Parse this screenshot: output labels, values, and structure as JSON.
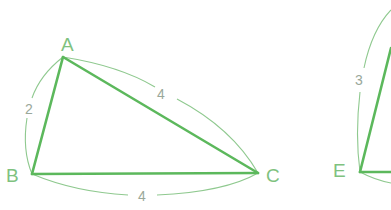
{
  "figure": {
    "colors": {
      "edge": "#5cb85c",
      "arc": "#8fc98f",
      "vertex_label": "#7fc27f",
      "measure_label": "#9aa89a",
      "background": "#ffffff"
    },
    "triangle_abc": {
      "vertices": {
        "A": {
          "label": "A",
          "x": 63,
          "y": 57
        },
        "B": {
          "label": "B",
          "x": 32,
          "y": 174
        },
        "C": {
          "label": "C",
          "x": 258,
          "y": 173
        }
      },
      "sides": {
        "AB": {
          "length": "2"
        },
        "AC": {
          "length": "4"
        },
        "BC": {
          "length": "4"
        }
      }
    },
    "triangle_def_partial": {
      "vertices": {
        "E": {
          "label": "E",
          "x": 360,
          "y": 172
        }
      },
      "sides": {
        "DE": {
          "length": "3"
        }
      }
    }
  }
}
